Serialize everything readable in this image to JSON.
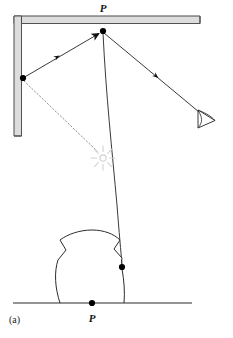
{
  "figure": {
    "panel_label": "(a)",
    "caption_label_top": "P",
    "caption_label_bottom": "P",
    "colors": {
      "stroke": "#2b2b2b",
      "wall_fill": "#d8d8d8",
      "wall_stroke": "#555555",
      "ray": "#3a3a3a",
      "dotted_ray": "#8a8a8a",
      "light_source": "#d5d5d5",
      "point": "#000000",
      "ground": "#2b2b2b",
      "background": "#ffffff"
    },
    "elements": {
      "wall_corner": {
        "name": "L-shaped mirror wall",
        "outer_top_y": 16,
        "outer_left_x": 14,
        "thickness": 7,
        "top_end_x": 200,
        "left_end_y": 136
      },
      "point_top": {
        "name": "reflection point P on ceiling",
        "x": 103,
        "y": 31,
        "label": "P"
      },
      "point_wall": {
        "name": "reflection point on vertical wall",
        "x": 23,
        "y": 78
      },
      "point_object": {
        "name": "contact point on object",
        "x": 122,
        "y": 267
      },
      "point_ground": {
        "name": "point P on ground",
        "x": 92,
        "y": 303,
        "label": "P"
      },
      "ray_wall_to_P": {
        "name": "incident ray from wall to P",
        "from": [
          23,
          78
        ],
        "to": [
          103,
          31
        ],
        "arrowhead": "large, at P end",
        "tick_marker": [
          60,
          56
        ]
      },
      "ray_P_to_eye": {
        "name": "reflected ray from P to observer eye",
        "from": [
          103,
          31
        ],
        "to": [
          199,
          112
        ],
        "tick_marker": [
          158,
          71
        ]
      },
      "ray_dotted": {
        "name": "virtual ray from wall point to light source",
        "from": [
          23,
          80
        ],
        "to": [
          98,
          152
        ],
        "style": "dotted"
      },
      "curved_ray": {
        "name": "curved light path from P to object",
        "from": [
          103,
          33
        ],
        "to": [
          122,
          266
        ],
        "style": "curved"
      },
      "light_source": {
        "name": "virtual light source starburst",
        "x": 103,
        "y": 158,
        "rays": 8,
        "core_radius": 3
      },
      "eye": {
        "name": "observer eye symbol",
        "x": 207,
        "y": 119
      },
      "object": {
        "name": "irregular blob object on ground",
        "center_x": 92,
        "base_y": 303,
        "width": 74,
        "height": 62
      },
      "ground_line": {
        "name": "ground surface line",
        "x1": 13,
        "x2": 192,
        "y": 303
      }
    }
  }
}
